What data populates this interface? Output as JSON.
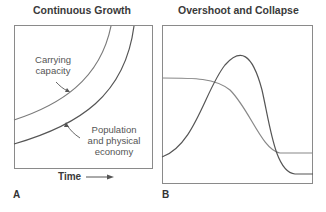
{
  "panels": [
    {
      "letter": "A",
      "title": "Continuous Growth",
      "annotations": {
        "carrying_capacity": [
          "Carrying",
          "capacity"
        ],
        "population": [
          "Population",
          "and physical",
          "economy"
        ]
      },
      "x_axis_label": "Time",
      "x_axis_arrow": "right-arrow-icon"
    },
    {
      "letter": "B",
      "title": "Overshoot and Collapse"
    }
  ],
  "colors": {
    "frame": "#8a8a8a",
    "carrying_capacity_line": "#7a7a7a",
    "population_line": "#555555",
    "text": "#3a3a3a"
  }
}
